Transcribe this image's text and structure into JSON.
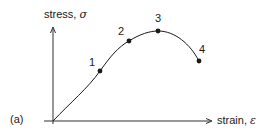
{
  "panel_label": "(a)",
  "y_axis": {
    "label": "stress, ",
    "symbol": "σ"
  },
  "x_axis": {
    "label": "strain, ",
    "symbol": "ε"
  },
  "points": [
    {
      "label": "1",
      "x": 100,
      "y": 71
    },
    {
      "label": "2",
      "x": 129,
      "y": 41
    },
    {
      "label": "3",
      "x": 158,
      "y": 31
    },
    {
      "label": "4",
      "x": 199,
      "y": 61
    }
  ],
  "colors": {
    "ink": "#1a1a1a",
    "background": "#ffffff"
  }
}
